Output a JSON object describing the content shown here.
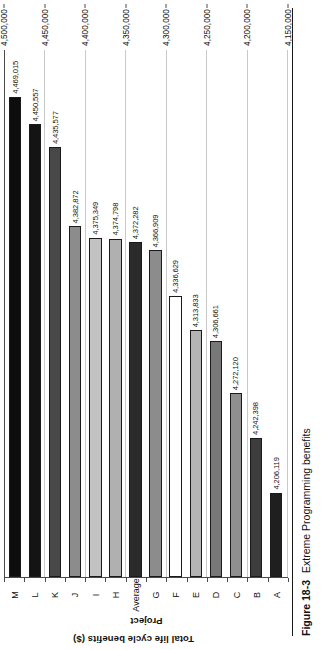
{
  "figure": {
    "caption_number": "Figure 18-3",
    "caption_text": "Extreme Programming benefits"
  },
  "chart_data": {
    "type": "bar",
    "orientation": "vertical",
    "title": "",
    "xlabel": "Project",
    "ylabel": "Total life cycle benefits ($)",
    "ylim": [
      4150000,
      4500000
    ],
    "ytick_labels": [
      "4,500,000",
      "4,450,000",
      "4,400,000",
      "4,350,000",
      "4,300,000",
      "4,250,000",
      "4,200,000",
      "4,150,000"
    ],
    "ytick_values": [
      4500000,
      4450000,
      4400000,
      4350000,
      4300000,
      4250000,
      4200000,
      4150000
    ],
    "grid": true,
    "legend": "none",
    "categories": [
      "A",
      "B",
      "C",
      "D",
      "E",
      "F",
      "G",
      "Average",
      "H",
      "I",
      "J",
      "K",
      "L",
      "M"
    ],
    "values": [
      4206119,
      4242398,
      4272120,
      4306661,
      4313833,
      4336629,
      4366909,
      4372282,
      4374798,
      4375349,
      4382872,
      4435577,
      4450557,
      4469015
    ],
    "value_labels": [
      "4,206,119",
      "4,242,398",
      "4,272,120",
      "4,306,661",
      "4,313,833",
      "4,336,629",
      "4,366,909",
      "4,372,282",
      "4,374,798",
      "4,375,349",
      "4,382,872",
      "4,435,577",
      "4,450,557",
      "4,469,015"
    ],
    "bar_colors": [
      "#1f1f1f",
      "#3d3d3d",
      "#8f8f8f",
      "#787878",
      "#b4b4b4",
      "#ffffff",
      "#8c8c8c",
      "#2b2b2b",
      "#b0b0b0",
      "#c2c2c2",
      "#8c8c8c",
      "#484848",
      "#141414",
      "#0d0d0d"
    ],
    "bar_border_color": "#1a1a1a",
    "axis_color": "#4a4a4a",
    "gridline_color": "#c9c9c9"
  }
}
